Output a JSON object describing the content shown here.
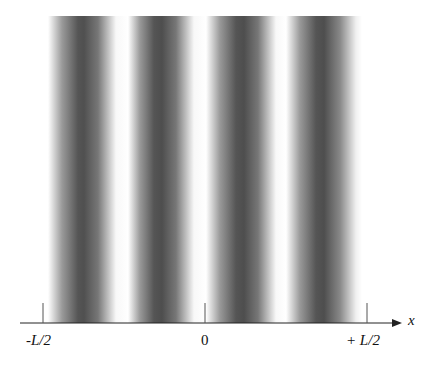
{
  "figure": {
    "axis_label": "x",
    "ticks": [
      {
        "label": "-L/2",
        "x": 43
      },
      {
        "label": "0",
        "x": 205
      },
      {
        "label": "+ L/2",
        "x": 367
      }
    ],
    "dark_fringe_count": 4
  }
}
